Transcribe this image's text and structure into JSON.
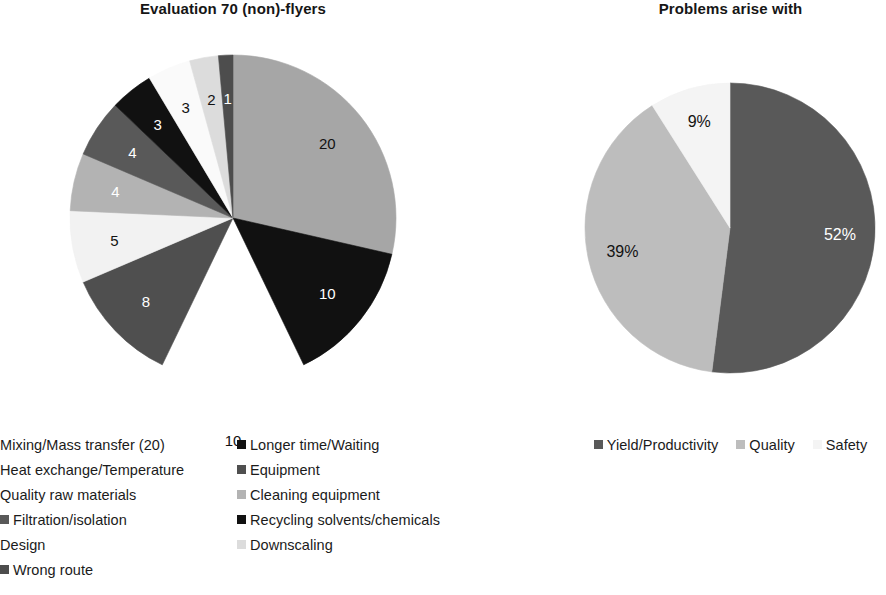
{
  "charts": {
    "left": {
      "title": "Evaluation 70 (non)-flyers",
      "legend": {
        "column_a": [
          {
            "label": "Mixing/Mass transfer (20)",
            "color": "#a6a6a6",
            "clipped": true
          },
          {
            "label": "Heat exchange/Temperature",
            "color": "#ffffff",
            "clipped": true
          },
          {
            "label": "Quality raw materials",
            "color": "#f2f2f2",
            "clipped": true
          },
          {
            "label": "Filtration/isolation",
            "color": "#595959",
            "clipped": false
          },
          {
            "label": "Design",
            "color": "#fafafa",
            "clipped": true
          },
          {
            "label": "Wrong route",
            "color": "#4d4d4d",
            "clipped": false
          }
        ],
        "column_b": [
          {
            "label": "Longer time/Waiting",
            "color": "#111111",
            "clipped": false
          },
          {
            "label": "Equipment",
            "color": "#4f4f4f",
            "clipped": false
          },
          {
            "label": "Cleaning equipment",
            "color": "#b3b3b3",
            "clipped": false
          },
          {
            "label": "Recycling solvents/chemicals",
            "color": "#111111",
            "clipped": false
          },
          {
            "label": "Downscaling",
            "color": "#dcdcdc",
            "clipped": false
          }
        ]
      }
    },
    "right": {
      "title": "Problems arise with",
      "legend": [
        {
          "label": "Yield/Productivity",
          "color": "#595959",
          "clipped": false
        },
        {
          "label": "Quality",
          "color": "#bdbdbd",
          "clipped": false
        },
        {
          "label": "Safety",
          "color": "#f4f4f4",
          "clipped": false
        }
      ]
    }
  },
  "chart_data": [
    {
      "type": "pie",
      "id": "evaluation-70-non-flyers",
      "title": "Evaluation 70 (non)-flyers",
      "total": 70,
      "units": "count",
      "start_angle_deg": 0,
      "direction": "clockwise",
      "exploded_slice": "Heat exchange/Temperature",
      "legend_position": "bottom-left",
      "labels": [
        "Mixing/Mass transfer (20)",
        "Longer time/Waiting",
        "Heat exchange/Temperature",
        "Equipment",
        "Quality raw materials",
        "Cleaning equipment",
        "Filtration/isolation",
        "Recycling solvents/chemicals",
        "Design",
        "Downscaling",
        "Wrong route"
      ],
      "values": [
        20,
        10,
        10,
        8,
        5,
        4,
        4,
        3,
        3,
        2,
        1
      ],
      "data_labels": [
        "20",
        "10",
        "10",
        "8",
        "5",
        "4",
        "4",
        "3",
        "3",
        "2",
        "1"
      ],
      "colors": [
        "#a6a6a6",
        "#111111",
        "#ffffff",
        "#4f4f4f",
        "#f2f2f2",
        "#b3b3b3",
        "#595959",
        "#111111",
        "#fafafa",
        "#dcdcdc",
        "#4d4d4d"
      ],
      "label_text_colors": [
        "#121212",
        "#ffffff",
        "#121212",
        "#ffffff",
        "#121212",
        "#ffffff",
        "#ffffff",
        "#ffffff",
        "#121212",
        "#121212",
        "#ffffff"
      ]
    },
    {
      "type": "pie",
      "id": "problems-arise-with",
      "title": "Problems arise with",
      "total": 100,
      "units": "percent",
      "start_angle_deg": 0,
      "direction": "clockwise",
      "legend_position": "bottom",
      "labels": [
        "Yield/Productivity",
        "Quality",
        "Safety"
      ],
      "values": [
        52,
        39,
        9
      ],
      "data_labels": [
        "52%",
        "39%",
        "9%"
      ],
      "colors": [
        "#595959",
        "#bdbdbd",
        "#f4f4f4"
      ],
      "label_text_colors": [
        "#ffffff",
        "#121212",
        "#121212"
      ]
    }
  ]
}
